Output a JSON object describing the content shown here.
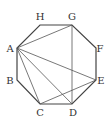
{
  "diagram": {
    "type": "regular-octagon-with-diagonals",
    "stroke_color": "#444444",
    "vertices": [
      {
        "name": "A",
        "x": 17,
        "y": 48,
        "lx": 10,
        "ly": 52
      },
      {
        "name": "B",
        "x": 17,
        "y": 80,
        "lx": 10,
        "ly": 84
      },
      {
        "name": "C",
        "x": 40,
        "y": 104,
        "lx": 40,
        "ly": 116
      },
      {
        "name": "D",
        "x": 72,
        "y": 104,
        "lx": 73,
        "ly": 116
      },
      {
        "name": "E",
        "x": 96,
        "y": 80,
        "lx": 101,
        "ly": 84
      },
      {
        "name": "F",
        "x": 96,
        "y": 48,
        "lx": 100,
        "ly": 52
      },
      {
        "name": "G",
        "x": 72,
        "y": 25,
        "lx": 72,
        "ly": 20
      },
      {
        "name": "H",
        "x": 40,
        "y": 25,
        "lx": 40,
        "ly": 20
      }
    ],
    "diagonals": [
      [
        "A",
        "G"
      ],
      [
        "A",
        "E"
      ],
      [
        "A",
        "D"
      ],
      [
        "A",
        "C"
      ],
      [
        "G",
        "D"
      ],
      [
        "C",
        "E"
      ]
    ],
    "labels": {
      "A": "A",
      "B": "B",
      "C": "C",
      "D": "D",
      "E": "E",
      "F": "F",
      "G": "G",
      "H": "H"
    }
  }
}
